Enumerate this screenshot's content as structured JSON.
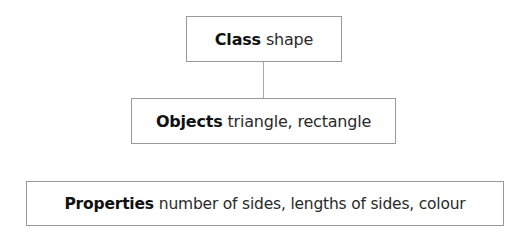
{
  "diagram": {
    "type": "hierarchy",
    "colors": {
      "border": "#9a9a9a",
      "connector": "#a8a8a8",
      "text": "#1e1e1e",
      "background": "#ffffff"
    },
    "nodes": [
      {
        "id": "class",
        "label": "Class",
        "value": "shape"
      },
      {
        "id": "objects",
        "label": "Objects",
        "value": "triangle, rectangle"
      },
      {
        "id": "properties",
        "label": "Properties",
        "value": "number of sides, lengths of sides, colour"
      }
    ],
    "edges": [
      {
        "from": "class",
        "to": "objects"
      }
    ]
  }
}
